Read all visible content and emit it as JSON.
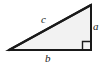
{
  "figure": {
    "name": "right-triangle-diagram",
    "type": "geometry-diagram",
    "shape": "right triangle",
    "background_color": "#ffffff",
    "stroke_color": "#1a1a1a",
    "fill_color": "#f2f2f2",
    "stroke_width": 2
  },
  "labels": {
    "hypotenuse": "c",
    "vertical_leg": "a",
    "horizontal_leg": "b"
  },
  "markers": {
    "right_angle": {
      "name": "right-angle-marker",
      "vertex": "bottom-right",
      "size": 8,
      "symbol": "square"
    }
  },
  "geometry": {
    "vertices": {
      "left": [
        9,
        50
      ],
      "bottom_right": [
        91,
        50
      ],
      "top_right": [
        91,
        5
      ]
    },
    "edges": [
      {
        "name": "hypotenuse",
        "from": "left",
        "to": "top_right",
        "label": "c"
      },
      {
        "name": "vertical-leg",
        "from": "top_right",
        "to": "bottom_right",
        "label": "a"
      },
      {
        "name": "horizontal-leg",
        "from": "bottom_right",
        "to": "left",
        "label": "b"
      }
    ]
  }
}
